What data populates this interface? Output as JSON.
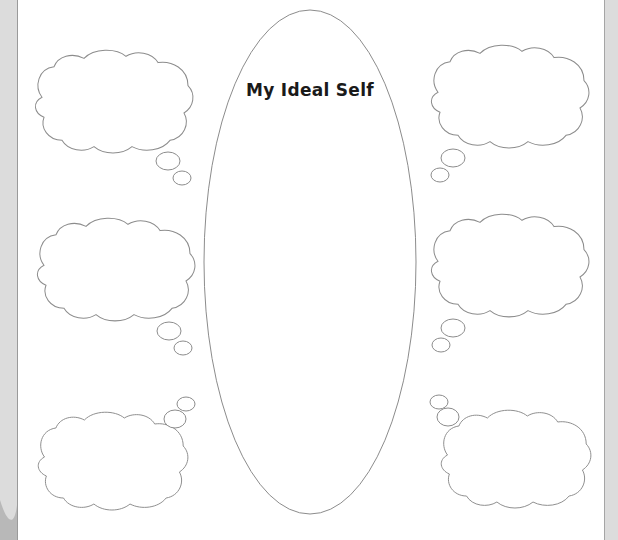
{
  "worksheet": {
    "title": "My Ideal Self",
    "line_color": "#8c8c8c",
    "border_color": "#dcdcdc",
    "thought_bubbles": [
      {
        "id": "top-left",
        "label": ""
      },
      {
        "id": "middle-left",
        "label": ""
      },
      {
        "id": "bottom-left",
        "label": ""
      },
      {
        "id": "top-right",
        "label": ""
      },
      {
        "id": "middle-right",
        "label": ""
      },
      {
        "id": "bottom-right",
        "label": ""
      }
    ]
  }
}
